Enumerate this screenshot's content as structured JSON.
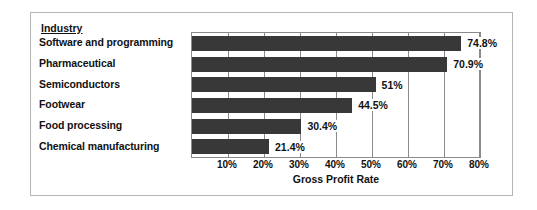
{
  "chart_data": {
    "type": "bar",
    "orientation": "horizontal",
    "title": "",
    "category_header": "Industry",
    "categories": [
      "Software and programming",
      "Pharmaceutical",
      "Semiconductors",
      "Footwear",
      "Food processing",
      "Chemical manufacturing"
    ],
    "values": [
      74.8,
      70.9,
      51,
      44.5,
      30.4,
      21.4
    ],
    "data_labels": [
      "74.8%",
      "70.9%",
      "51%",
      "44.5%",
      "30.4%",
      "21.4%"
    ],
    "xlabel": "Gross Profit Rate",
    "ylabel": "",
    "xlim": [
      0,
      80
    ],
    "tick_values": [
      10,
      20,
      30,
      40,
      50,
      60,
      70,
      80
    ],
    "tick_labels": [
      "10%",
      "20%",
      "30%",
      "40%",
      "50%",
      "60%",
      "70%",
      "80%"
    ],
    "grid": true,
    "legend": false,
    "bar_color": "#383838",
    "plot_border_color": "#8a8a8a",
    "frame_border_color": "#b4b4b4",
    "background": "#ffffff"
  }
}
